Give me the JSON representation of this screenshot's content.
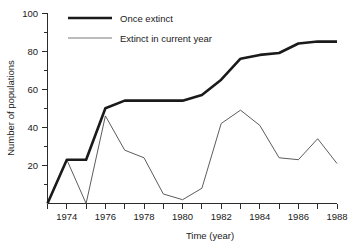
{
  "chart_data": {
    "type": "line",
    "title": "",
    "xlabel": "Time (year)",
    "ylabel": "Number of populations",
    "xlim": [
      1973,
      1988
    ],
    "ylim": [
      0,
      100
    ],
    "grid": false,
    "legend_position": "top-center",
    "x": [
      1973,
      1974,
      1975,
      1976,
      1977,
      1978,
      1979,
      1980,
      1981,
      1982,
      1983,
      1984,
      1985,
      1986,
      1987,
      1988
    ],
    "xticks": [
      1973,
      1974,
      1975,
      1976,
      1977,
      1978,
      1979,
      1980,
      1981,
      1982,
      1983,
      1984,
      1985,
      1986,
      1987,
      1988
    ],
    "xtick_labels": [
      "",
      "1974",
      "",
      "1976",
      "",
      "1978",
      "",
      "1980",
      "",
      "1982",
      "",
      "1984",
      "",
      "1986",
      "",
      "1988"
    ],
    "yticks": [
      0,
      10,
      20,
      30,
      40,
      50,
      60,
      70,
      80,
      90,
      100
    ],
    "ytick_labels": [
      "",
      "",
      "20",
      "",
      "40",
      "",
      "60",
      "",
      "80",
      "",
      "100"
    ],
    "series": [
      {
        "name": "Once extinct",
        "style": "thick",
        "values": [
          0,
          23,
          23,
          50,
          54,
          54,
          54,
          54,
          57,
          65,
          76,
          78,
          79,
          84,
          85,
          85
        ]
      },
      {
        "name": "Extinct in current year",
        "style": "thin",
        "values": [
          0,
          23,
          0,
          46,
          28,
          24,
          5,
          2,
          8,
          42,
          49,
          41,
          24,
          23,
          34,
          21
        ]
      }
    ]
  },
  "legend": {
    "items": [
      {
        "label": "Once extinct"
      },
      {
        "label": "Extinct in current year"
      }
    ]
  },
  "axes": {
    "x_title": "Time (year)",
    "y_title": "Number of populations",
    "x_labels": [
      "1974",
      "1976",
      "1978",
      "1980",
      "1982",
      "1984",
      "1986",
      "1988"
    ],
    "y_labels": [
      "20",
      "40",
      "60",
      "80",
      "100"
    ]
  },
  "colors": {
    "ink": "#1a1a1a",
    "thin_line": "#4a4a4a",
    "background": "#ffffff"
  }
}
